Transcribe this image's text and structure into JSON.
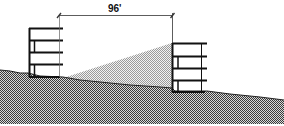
{
  "diagram": {
    "type": "architectural-section",
    "dimension": {
      "label": "96'"
    },
    "elements": [
      {
        "name": "left-building",
        "floors": 4
      },
      {
        "name": "right-building",
        "floors": 4
      },
      {
        "name": "sloped-terrain"
      },
      {
        "name": "sightline-shadow-triangle"
      }
    ]
  },
  "colors": {
    "line": "#111111",
    "ground": "#7a7a7a",
    "shadow": "#c9c9c9",
    "background": "#ffffff"
  }
}
